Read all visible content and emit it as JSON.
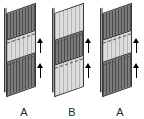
{
  "figure": {
    "background_color": "#ffffff",
    "panel_count": 3,
    "colors": {
      "dark_band": "#6f6f6f",
      "light_band": "#d6d6d6",
      "outline": "#3a3a3a",
      "arrow": "#000000",
      "label_text": "#262626"
    },
    "panels": [
      {
        "label": "A",
        "bands": [
          {
            "shade": "dark",
            "height_pct": 33
          },
          {
            "shade": "light",
            "height_pct": 27
          },
          {
            "shade": "dark",
            "height_pct": 40
          }
        ],
        "arrows": [
          {
            "direction": "up",
            "position": "upper"
          },
          {
            "direction": "up",
            "position": "lower"
          }
        ]
      },
      {
        "label": "B",
        "bands": [
          {
            "shade": "light",
            "height_pct": 33
          },
          {
            "shade": "dark",
            "height_pct": 30
          },
          {
            "shade": "light",
            "height_pct": 37
          }
        ],
        "arrows": [
          {
            "direction": "up",
            "position": "upper"
          },
          {
            "direction": "up",
            "position": "lower"
          }
        ]
      },
      {
        "label": "A",
        "bands": [
          {
            "shade": "dark",
            "height_pct": 33
          },
          {
            "shade": "light",
            "height_pct": 27
          },
          {
            "shade": "dark",
            "height_pct": 40
          }
        ],
        "arrows": [
          {
            "direction": "up",
            "position": "upper"
          },
          {
            "direction": "up",
            "position": "lower"
          }
        ]
      }
    ]
  }
}
